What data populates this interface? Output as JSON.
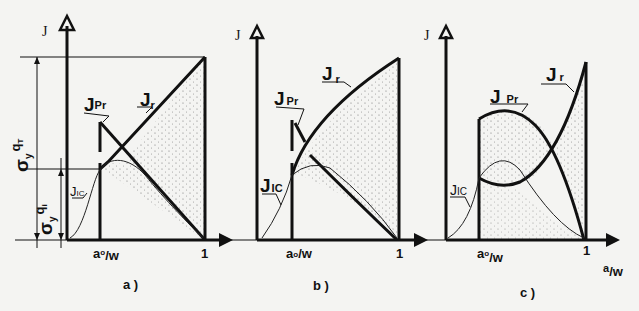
{
  "figure": {
    "panels": [
      {
        "id": "a",
        "caption": "a )",
        "y_axis_label": "J",
        "x_tick_a0": "a₀/w",
        "x_tick_one": "1",
        "curve_labels": {
          "Jr": "J",
          "Jr_sub": "r",
          "JPr": "J",
          "JPr_sub": "Pr",
          "JIC": "J",
          "JIC_sub": "IC"
        },
        "dimension_labels": {
          "upper": "σy qT",
          "lower": "σy qi"
        }
      },
      {
        "id": "b",
        "caption": "b )",
        "y_axis_label": "J",
        "x_tick_a0": "a₀/w",
        "x_tick_one": "1",
        "curve_labels": {
          "Jr": "J",
          "Jr_sub": "r",
          "JPr": "J",
          "JPr_sub": "Pr",
          "JIC": "J",
          "JIC_sub": "IC"
        }
      },
      {
        "id": "c",
        "caption": "c )",
        "y_axis_label": "J",
        "x_tick_a0": "a₀/w",
        "x_tick_one": "1",
        "x_axis_label": "a/w",
        "curve_labels": {
          "Jr": "J",
          "Jr_sub": "r",
          "JPr": "J",
          "JPr_sub": "Pr",
          "JIC": "J",
          "JIC_sub": "IC"
        }
      }
    ],
    "sigma": {
      "symbol": "σ",
      "sub_y": "y",
      "q_upper": "q",
      "q_upper_sub": "T",
      "q_lower": "q",
      "q_lower_sub": "i"
    },
    "a0": {
      "a": "a",
      "o": "o",
      "w": "/w"
    },
    "axis_c_x": {
      "a": "a",
      "w": "/w"
    },
    "colors": {
      "ink": "#111111",
      "paper": "#f4f4f2",
      "stipple": "#555555"
    }
  }
}
